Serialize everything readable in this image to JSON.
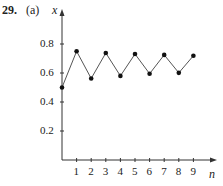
{
  "problem": {
    "number": "29.",
    "part": "(a)"
  },
  "chart_data": {
    "type": "line",
    "title": "",
    "xlabel": "n",
    "ylabel": "x",
    "x": [
      0,
      1,
      2,
      3,
      4,
      5,
      6,
      7,
      8,
      9
    ],
    "values": [
      0.5,
      0.75,
      0.5625,
      0.738,
      0.58,
      0.731,
      0.595,
      0.725,
      0.601,
      0.719
    ],
    "x_ticks": [
      "1",
      "2",
      "3",
      "4",
      "5",
      "6",
      "7",
      "8",
      "9"
    ],
    "y_ticks": [
      "0.2",
      "0.4",
      "0.6",
      "0.8"
    ],
    "ylim": [
      0,
      1.0
    ],
    "xlim": [
      0,
      10
    ],
    "grid": false,
    "markers": true
  }
}
